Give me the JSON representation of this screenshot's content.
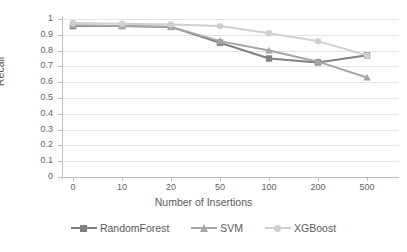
{
  "chart_data": {
    "type": "line",
    "title": "",
    "xlabel": "Number of Insertions",
    "ylabel": "Recall",
    "categories": [
      "0",
      "10",
      "20",
      "50",
      "100",
      "200",
      "500"
    ],
    "ylim": [
      0,
      1
    ],
    "ytick_labels": [
      "0",
      "0.1",
      "0.2",
      "0.3",
      "0.4",
      "0.5",
      "0.6",
      "0.7",
      "0.8",
      "0.9",
      "1"
    ],
    "ytick_values": [
      0,
      0.1,
      0.2,
      0.3,
      0.4,
      0.5,
      0.6,
      0.7,
      0.8,
      0.9,
      1
    ],
    "grid": true,
    "legend_position": "bottom",
    "series": [
      {
        "name": "RandomForest",
        "color": "#808080",
        "marker": "square",
        "values": [
          0.955,
          0.955,
          0.95,
          0.85,
          0.75,
          0.725,
          0.77
        ]
      },
      {
        "name": "SVM",
        "color": "#a6a6a6",
        "marker": "triangle",
        "values": [
          0.96,
          0.955,
          0.95,
          0.86,
          0.8,
          0.73,
          0.63
        ]
      },
      {
        "name": "XGBoost",
        "color": "#cfcfcf",
        "marker": "circle",
        "values": [
          0.975,
          0.97,
          0.965,
          0.955,
          0.91,
          0.86,
          0.77
        ]
      }
    ]
  },
  "axes": {
    "y_title": "Recall",
    "x_title": "Number of Insertions"
  }
}
